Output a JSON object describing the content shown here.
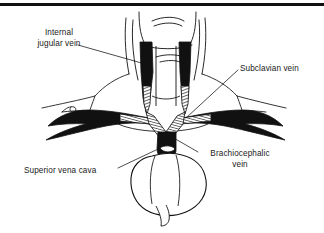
{
  "figure": {
    "type": "anatomical-line-diagram",
    "background_color": "#ffffff",
    "ink_color": "#111111",
    "top_rule_color": "#111111"
  },
  "labels": {
    "internal_jugular_vein": "Internal\njugular vein",
    "subclavian_vein": "Subclavian vein",
    "brachiocephalic_vein": "Brachiocephalic\nvein",
    "superior_vena_cava": "Superior vena cava"
  },
  "structures": [
    {
      "name": "chin-and-jaw",
      "fill": "none",
      "stroke": "#111111"
    },
    {
      "name": "neck-outline",
      "fill": "none",
      "stroke": "#111111"
    },
    {
      "name": "left-internal-jugular-vein",
      "fill": "#111111",
      "stroke": "#111111"
    },
    {
      "name": "right-internal-jugular-vein",
      "fill": "#111111",
      "stroke": "#111111"
    },
    {
      "name": "left-subclavian-vein",
      "fill": "#111111",
      "stroke": "#111111"
    },
    {
      "name": "right-subclavian-vein",
      "fill": "#111111",
      "stroke": "#111111"
    },
    {
      "name": "left-brachiocephalic-vein",
      "fill": "#111111",
      "stroke": "#111111"
    },
    {
      "name": "right-brachiocephalic-vein",
      "fill": "#111111",
      "stroke": "#111111"
    },
    {
      "name": "superior-vena-cava",
      "fill": "#111111",
      "stroke": "#111111"
    },
    {
      "name": "heart-outline",
      "fill": "none",
      "stroke": "#111111"
    },
    {
      "name": "clavicle-and-shoulder-contours",
      "fill": "none",
      "stroke": "#111111"
    }
  ],
  "leader_lines": [
    {
      "name": "leader-internal-jugular-vein",
      "from": "label-internal-jugular-vein",
      "to": "left-internal-jugular-vein"
    },
    {
      "name": "leader-subclavian-vein",
      "from": "label-subclavian-vein",
      "to": "right-subclavian-vein"
    },
    {
      "name": "leader-brachiocephalic-vein",
      "from": "label-brachiocephalic-vein",
      "to": "right-brachiocephalic-vein"
    },
    {
      "name": "leader-superior-vena-cava",
      "from": "label-superior-vena-cava",
      "to": "superior-vena-cava"
    }
  ]
}
